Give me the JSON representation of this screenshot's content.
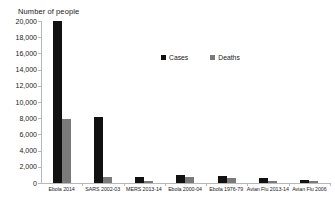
{
  "chart_data": {
    "type": "bar",
    "title": "",
    "ylabel": "Number of people",
    "xlabel": "",
    "ylim": [
      0,
      20000
    ],
    "ytick_step": 2000,
    "yticks": [
      "0",
      "2,000",
      "4,000",
      "6,000",
      "8,000",
      "10,000",
      "12,000",
      "14,000",
      "16,000",
      "18,000",
      "20,000"
    ],
    "grid": false,
    "legend_position": "upper-center",
    "categories": [
      "Ebola 2014",
      "SARS 2002-03",
      "MERS 2013-14",
      "Ebola 2000-04",
      "Ebola 1976-79",
      "Avian Flu 2013-14",
      "Avian Flu 2006"
    ],
    "series": [
      {
        "name": "Cases",
        "color": "#111111",
        "values": [
          20000,
          8100,
          700,
          1000,
          900,
          650,
          350
        ]
      },
      {
        "name": "Deaths",
        "color": "#7a7a7a",
        "values": [
          7900,
          800,
          280,
          700,
          600,
          250,
          200
        ]
      }
    ]
  },
  "legend": {
    "items": [
      {
        "label": "Cases"
      },
      {
        "label": "Deaths"
      }
    ]
  }
}
